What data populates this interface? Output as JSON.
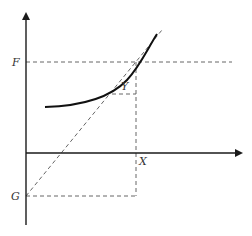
{
  "diagram": {
    "labels": {
      "f": "F",
      "g": "G",
      "x": "X",
      "y": "Y"
    },
    "elements": {
      "vertical_axis": "y-axis with arrow",
      "horizontal_axis": "x-axis with arrow",
      "curve": "convex increasing curve",
      "diagonal": "dashed line from G through intersection of F and X",
      "guides": [
        "dashed horizontal at F",
        "dashed horizontal at G",
        "dashed vertical at X",
        "dashed short horizontal at Y"
      ]
    },
    "colors": {
      "axis": "#1a1a1a",
      "curve": "#111111",
      "dashed": "#555555",
      "label": "#333333"
    }
  }
}
